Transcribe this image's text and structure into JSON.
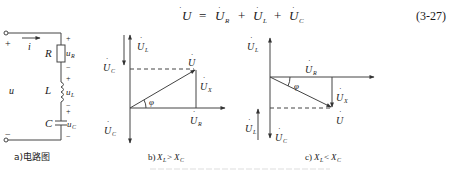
{
  "equation": {
    "lhs": "U",
    "eq": "=",
    "terms": [
      {
        "sym": "U",
        "sub": "R"
      },
      {
        "sym": "U",
        "sub": "L"
      },
      {
        "sym": "U",
        "sub": "C"
      }
    ],
    "plus": "+",
    "number": "(3-27)"
  },
  "circuit": {
    "caption": "a)电路图",
    "current_label": "i",
    "source_label": "u",
    "terminal_plus": "+",
    "terminal_minus": "−",
    "elements": [
      {
        "name": "R",
        "voltage": "u",
        "voltage_sub": "R",
        "plus": "+",
        "minus": "−"
      },
      {
        "name": "L",
        "voltage": "u",
        "voltage_sub": "L",
        "plus": "+",
        "minus": "−"
      },
      {
        "name": "C",
        "voltage": "u",
        "voltage_sub": "C",
        "plus": "+",
        "minus": "−"
      }
    ]
  },
  "phasor_b": {
    "caption_prefix": "b)",
    "caption_lhs": "X",
    "caption_lhs_sub": "L",
    "caption_op": ">",
    "caption_rhs": "X",
    "caption_rhs_sub": "C",
    "labels": {
      "UL": {
        "sym": "U",
        "sub": "L"
      },
      "UC_top": {
        "sym": "U",
        "sub": "C"
      },
      "UC_bottom": {
        "sym": "U",
        "sub": "C"
      },
      "U": {
        "sym": "U",
        "sub": ""
      },
      "UX": {
        "sym": "U",
        "sub": "X"
      },
      "UR": {
        "sym": "U",
        "sub": "R"
      },
      "phi": "φ"
    }
  },
  "phasor_c": {
    "caption_prefix": "c)",
    "caption_lhs": "X",
    "caption_lhs_sub": "L",
    "caption_op": "<",
    "caption_rhs": "X",
    "caption_rhs_sub": "C",
    "labels": {
      "UL_top": {
        "sym": "U",
        "sub": "L"
      },
      "UL_bottom": {
        "sym": "U",
        "sub": "L"
      },
      "UC": {
        "sym": "U",
        "sub": "C"
      },
      "U": {
        "sym": "U",
        "sub": ""
      },
      "UX": {
        "sym": "U",
        "sub": "X"
      },
      "UR": {
        "sym": "U",
        "sub": "R"
      },
      "phi": "φ"
    }
  }
}
